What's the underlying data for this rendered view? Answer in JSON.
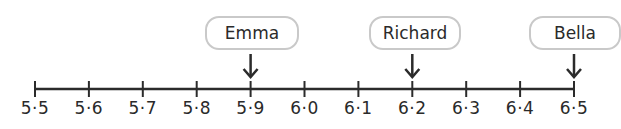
{
  "number_line": {
    "start": 5.5,
    "end": 6.5,
    "step": 0.1,
    "tick_labels": [
      "5·5",
      "5·6",
      "5·7",
      "5·8",
      "5·9",
      "6·0",
      "6·1",
      "6·2",
      "6·3",
      "6·4",
      "6·5"
    ],
    "line_color": "#2b2b2b",
    "box_border_color": "#c9c9c9"
  },
  "markers": [
    {
      "name": "Emma",
      "value": 5.9,
      "tick_index": 4
    },
    {
      "name": "Richard",
      "value": 6.2,
      "tick_index": 7
    },
    {
      "name": "Bella",
      "value": 6.5,
      "tick_index": 10
    }
  ]
}
